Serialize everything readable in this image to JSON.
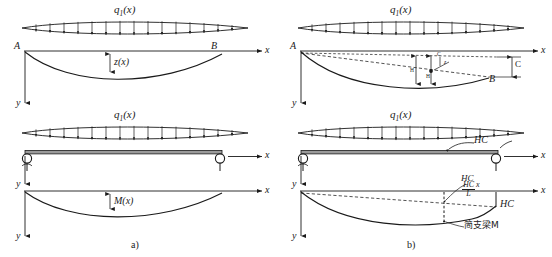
{
  "figure": {
    "caption_a": "a)",
    "caption_b": "b)"
  },
  "panel_a": {
    "load_label": "q",
    "load_sub": "1",
    "load_arg": "(x)",
    "load_label_2": "q",
    "load_sub_2": "1",
    "load_arg_2": "(x)",
    "node_a": "A",
    "node_b": "B",
    "axis_x": "x",
    "axis_y_top": "y",
    "axis_y_mid": "y",
    "axis_y_bot": "y",
    "deflection_label": "z",
    "deflection_arg": "(x)",
    "moment_label": "M",
    "moment_arg": "(x)"
  },
  "panel_b": {
    "load_label": "q",
    "load_sub": "1",
    "load_arg": "(x)",
    "load_label_2": "q",
    "load_sub_2": "1",
    "load_arg_2": "(x)",
    "node_a": "A",
    "node_b": "B",
    "axis_x": "x",
    "axis_y_top": "y",
    "axis_y_mid": "y",
    "axis_y_bot": "y",
    "dim_c": "C",
    "cable_force_top": "HC",
    "cable_force_mid": "HC",
    "cable_force_right": "HC",
    "fraction_num": "HC",
    "fraction_den": "L",
    "fraction_mult": "x",
    "simple_beam_moment": "简支梁M",
    "detail_h": "H",
    "detail_h2": "H",
    "detail_c": "C",
    "detail_z": "z"
  },
  "style": {
    "ink": "#1a1a1a",
    "beam_fill": "#9a9a9a"
  }
}
